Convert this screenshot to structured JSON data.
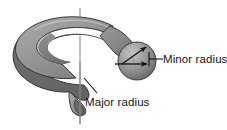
{
  "figure": {
    "background_color": "#ffffff",
    "width": 227,
    "height": 130
  },
  "labels": {
    "minor_radius": "Minor radius",
    "major_radius": "Major radius"
  },
  "colors": {
    "torus_top_light": "#9d9d9d",
    "torus_top_mid": "#8a8a8a",
    "torus_outer_dark": "#6f6f6f",
    "torus_edge_stroke": "#2b2b2b",
    "sphere_light": "#b9b9b9",
    "sphere_dark": "#5e5e5e",
    "axis_line": "#8c8c8c",
    "leader_line": "#1a1a1a",
    "text": "#141414",
    "inner_hole": "#ffffff"
  },
  "elements": {
    "torus_name": "torus-body",
    "axis_name": "axis-of-revolution",
    "sphere_name": "minor-radius-sphere",
    "cross_section_name": "cut-cross-section",
    "minor_arrow_diagonal": "minor-radius-arrow",
    "minor_arrow_horizontal": "sphere-center-arrow"
  },
  "geometry": {
    "axis_x": 80,
    "axis_y_top": 8,
    "axis_y_bottom": 124,
    "sphere_center_x": 137,
    "sphere_center_y": 61,
    "sphere_radius": 19
  }
}
